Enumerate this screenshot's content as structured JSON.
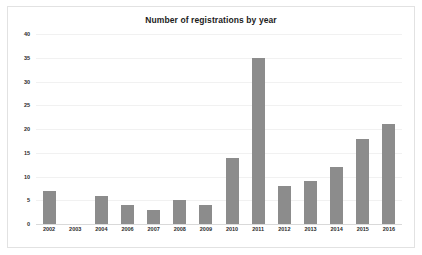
{
  "chart_data": {
    "type": "bar",
    "title": "Number of registrations by year",
    "xlabel": "",
    "ylabel": "",
    "categories": [
      "2002",
      "2003",
      "2004",
      "2006",
      "2007",
      "2008",
      "2009",
      "2010",
      "2011",
      "2012",
      "2013",
      "2014",
      "2015",
      "2016"
    ],
    "values": [
      7,
      0,
      6,
      4,
      3,
      5,
      4,
      14,
      35,
      8,
      9,
      12,
      18,
      21
    ],
    "ylim": [
      0,
      40
    ],
    "ytick_values": [
      0,
      5,
      10,
      15,
      20,
      25,
      30,
      35,
      40
    ],
    "ytick_labels": [
      "0",
      "5",
      "10",
      "15",
      "20",
      "25",
      "30",
      "35",
      "40"
    ],
    "grid": true,
    "legend": false,
    "bar_color": "#8c8c8c",
    "background_color": "#ffffff",
    "gridline_color": "#f1f1f1",
    "axis_color": "#d9d9d9",
    "text_color": "#2b2b2b"
  }
}
